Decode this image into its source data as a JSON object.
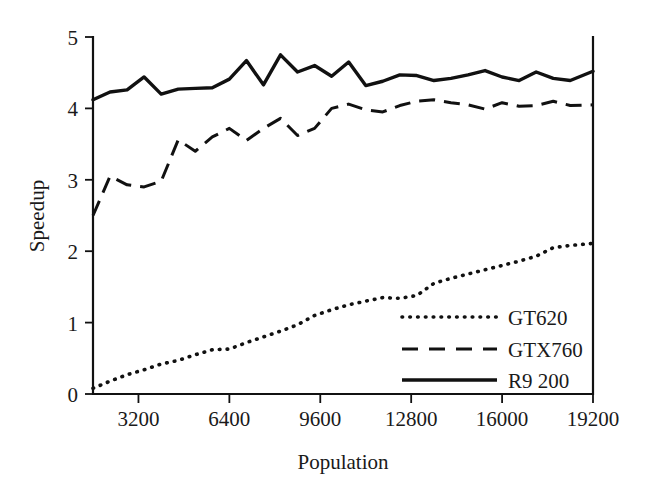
{
  "chart_data": {
    "type": "line",
    "title": "",
    "xlabel": "Population",
    "ylabel": "Speedup",
    "xlim": [
      1600,
      19200
    ],
    "ylim": [
      0,
      5
    ],
    "grid": false,
    "legend_position": "bottom-right inside plot",
    "xticks": [
      "3200",
      "6400",
      "9600",
      "12800",
      "16000",
      "19200"
    ],
    "xtick_values": [
      3200,
      6400,
      9600,
      12800,
      16000,
      19200
    ],
    "yticks": [
      "0",
      "1",
      "2",
      "3",
      "4",
      "5"
    ],
    "ytick_values": [
      0,
      1,
      2,
      3,
      4,
      5
    ],
    "x": [
      1600,
      2200,
      2800,
      3400,
      4000,
      4600,
      5200,
      5800,
      6400,
      7000,
      7600,
      8200,
      8800,
      9400,
      10000,
      10600,
      11200,
      11800,
      12400,
      13000,
      13600,
      14200,
      14800,
      15400,
      16000,
      16600,
      17200,
      17800,
      18400,
      19200
    ],
    "series": [
      {
        "name": "GT620",
        "style": "dotted",
        "color": "#111111",
        "values": [
          0.08,
          0.18,
          0.27,
          0.34,
          0.42,
          0.47,
          0.55,
          0.62,
          0.63,
          0.72,
          0.8,
          0.88,
          0.97,
          1.1,
          1.18,
          1.25,
          1.3,
          1.35,
          1.34,
          1.38,
          1.55,
          1.62,
          1.68,
          1.74,
          1.8,
          1.86,
          1.93,
          2.05,
          2.08,
          2.11
        ]
      },
      {
        "name": "GTX760",
        "style": "dashed",
        "color": "#111111",
        "values": [
          2.5,
          3.05,
          2.93,
          2.9,
          2.98,
          3.56,
          3.4,
          3.6,
          3.72,
          3.55,
          3.72,
          3.86,
          3.62,
          3.72,
          4.0,
          4.06,
          3.98,
          3.95,
          4.04,
          4.1,
          4.12,
          4.08,
          4.05,
          3.99,
          4.08,
          4.03,
          4.04,
          4.1,
          4.04,
          4.05
        ]
      },
      {
        "name": "R9 200",
        "style": "solid",
        "color": "#111111",
        "values": [
          4.12,
          4.23,
          4.26,
          4.44,
          4.2,
          4.27,
          4.28,
          4.29,
          4.41,
          4.67,
          4.33,
          4.75,
          4.51,
          4.6,
          4.45,
          4.65,
          4.32,
          4.38,
          4.47,
          4.46,
          4.39,
          4.42,
          4.47,
          4.53,
          4.44,
          4.39,
          4.51,
          4.42,
          4.39,
          4.52
        ]
      }
    ]
  },
  "legend": {
    "items": [
      {
        "label": "GT620",
        "style": "dotted"
      },
      {
        "label": "GTX760",
        "style": "dashed"
      },
      {
        "label": "R9 200",
        "style": "solid"
      }
    ]
  }
}
